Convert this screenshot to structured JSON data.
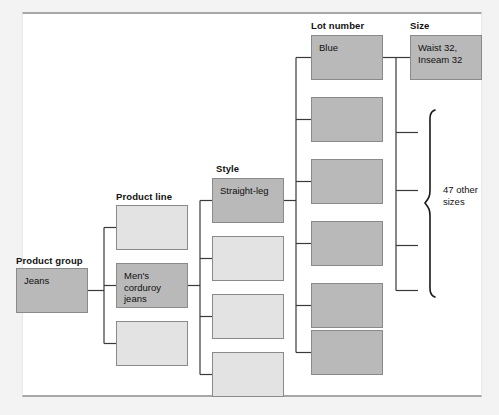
{
  "diagram": {
    "type": "hierarchy-tree",
    "title": "",
    "columns": [
      {
        "key": "product_group",
        "label": "Product group",
        "label_x": 16,
        "label_y": 255,
        "box_x": 16,
        "box_w": 72,
        "box_h": 45,
        "nodes": [
          {
            "text": "Jeans",
            "y": 268,
            "selected": true
          }
        ]
      },
      {
        "key": "product_line",
        "label": "Product line",
        "label_x": 116,
        "label_y": 191,
        "box_x": 116,
        "box_w": 72,
        "box_h": 45,
        "nodes": [
          {
            "text": "",
            "y": 205,
            "selected": false
          },
          {
            "text": "Men's corduroy jeans",
            "y": 263,
            "selected": true
          },
          {
            "text": "",
            "y": 321,
            "selected": false
          }
        ]
      },
      {
        "key": "style",
        "label": "Style",
        "label_x": 216,
        "label_y": 163,
        "box_x": 212,
        "box_w": 72,
        "box_h": 45,
        "nodes": [
          {
            "text": "Straight-leg",
            "y": 178,
            "selected": true
          },
          {
            "text": "",
            "y": 236,
            "selected": false
          },
          {
            "text": "",
            "y": 294,
            "selected": false
          },
          {
            "text": "",
            "y": 352,
            "selected": false
          }
        ]
      },
      {
        "key": "lot_number",
        "label": "Lot number",
        "label_x": 311,
        "label_y": 20,
        "box_x": 311,
        "box_w": 72,
        "box_h": 45,
        "nodes": [
          {
            "text": "Blue",
            "y": 35,
            "selected": true
          },
          {
            "text": "",
            "y": 97,
            "selected": true
          },
          {
            "text": "",
            "y": 159,
            "selected": true
          },
          {
            "text": "",
            "y": 221,
            "selected": true
          },
          {
            "text": "",
            "y": 283,
            "selected": true
          },
          {
            "text": "",
            "y": 330,
            "selected": true
          }
        ]
      },
      {
        "key": "size",
        "label": "Size",
        "label_x": 410,
        "label_y": 20,
        "box_x": 410,
        "box_w": 72,
        "box_h": 45,
        "nodes": [
          {
            "text": "Waist 32, Inseam 32",
            "y": 35,
            "selected": true
          }
        ],
        "brace": {
          "label": "47 other\nsizes",
          "label_x": 447,
          "label_y": 190,
          "top_y": 110,
          "bottom_y": 297,
          "x": 430
        }
      }
    ],
    "colors": {
      "selected_fill": "#b9b9b9",
      "empty_fill": "#e3e3e3",
      "node_border": "#8a8a8a",
      "connector": "#3a3a3a",
      "brace": "#1a1a1a",
      "panel_background": "#ffffff",
      "page_background": "#f3f3f3",
      "text": "#101010"
    }
  }
}
